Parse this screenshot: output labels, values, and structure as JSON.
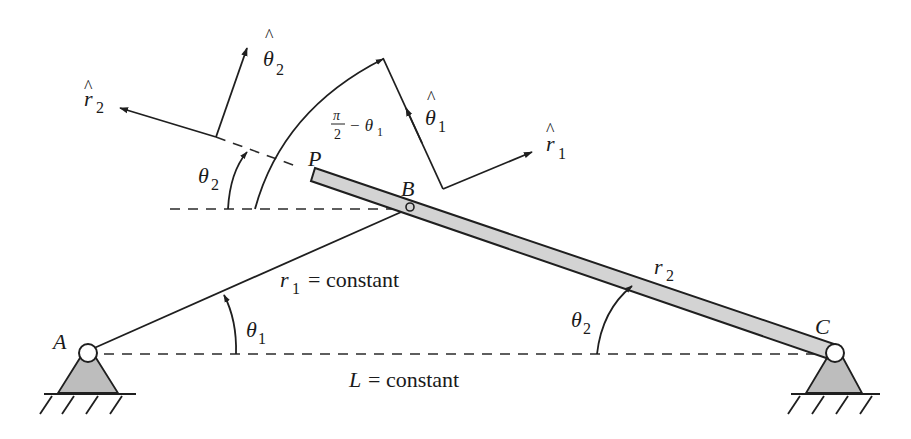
{
  "diagram": {
    "colors": {
      "line": "#1f1f1f",
      "link_fill": "#d3d3d3",
      "support_fill": "#bdbdbd",
      "background": "#ffffff"
    },
    "points": {
      "A": {
        "label": "A"
      },
      "B": {
        "label": "B"
      },
      "C": {
        "label": "C"
      },
      "P": {
        "label": "P"
      }
    },
    "links": {
      "r1": {
        "symbol": "r",
        "subscript": "1",
        "note": "= constant"
      },
      "r2": {
        "symbol": "r",
        "subscript": "2"
      },
      "ground": {
        "symbol": "L",
        "note": "= constant"
      }
    },
    "angles": {
      "theta1": {
        "symbol": "θ",
        "subscript": "1"
      },
      "theta2_at_C": {
        "symbol": "θ",
        "subscript": "2"
      },
      "theta2_at_P": {
        "symbol": "θ",
        "subscript": "2"
      },
      "complement": {
        "numerator": "π",
        "denominator": "2",
        "rest": "− θ",
        "subscript": "1"
      }
    },
    "unit_vectors": {
      "r1_hat": {
        "hat": "^",
        "symbol": "r",
        "subscript": "1"
      },
      "theta1_hat": {
        "hat": "^",
        "symbol": "θ",
        "subscript": "1"
      },
      "r2_hat": {
        "hat": "^",
        "symbol": "r",
        "subscript": "2"
      },
      "theta2_hat": {
        "hat": "^",
        "symbol": "θ",
        "subscript": "2"
      }
    }
  }
}
